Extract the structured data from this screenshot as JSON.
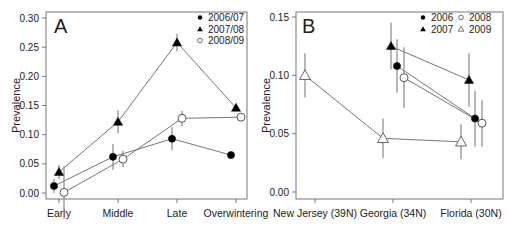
{
  "chart_data": [
    {
      "panel": "A",
      "type": "line",
      "title": "",
      "panel_label": "A",
      "xlabel": "",
      "ylabel": "Prevalence",
      "categories": [
        "Early",
        "Middle",
        "Late",
        "Overwintering"
      ],
      "ylim": [
        0.0,
        0.3
      ],
      "yticks": [
        "0.00",
        "0.05",
        "0.10",
        "0.15",
        "0.20",
        "0.25",
        "0.30"
      ],
      "grid": false,
      "legend_position": "top-right",
      "error_bars": true,
      "series": [
        {
          "name": "2006/07",
          "marker": "filled-circle",
          "values": [
            0.012,
            0.062,
            0.093,
            0.065
          ],
          "err": [
            0.012,
            0.022,
            0.02,
            0.003
          ]
        },
        {
          "name": "2007/08",
          "marker": "filled-triangle",
          "values": [
            0.036,
            0.122,
            0.258,
            0.146
          ],
          "err": [
            0.012,
            0.02,
            0.015,
            0.006
          ]
        },
        {
          "name": "2008/09",
          "marker": "open-circle",
          "values": [
            0.001,
            0.058,
            0.128,
            0.13
          ],
          "err": [
            0.045,
            0.014,
            0.013,
            0.006
          ]
        }
      ]
    },
    {
      "panel": "B",
      "type": "line",
      "title": "",
      "panel_label": "B",
      "xlabel": "",
      "ylabel": "Prevalence",
      "categories": [
        "New Jersey (39N)",
        "Georgia (34N)",
        "Florida (30N)"
      ],
      "ylim": [
        0.0,
        0.15
      ],
      "yticks": [
        "0.00",
        "0.05",
        "0.10",
        "0.15"
      ],
      "grid": false,
      "legend_position": "top-right",
      "error_bars": true,
      "series": [
        {
          "name": "2006",
          "marker": "filled-circle",
          "values": [
            null,
            0.108,
            0.063
          ],
          "err": [
            null,
            0.023,
            0.024
          ]
        },
        {
          "name": "2007",
          "marker": "filled-triangle",
          "values": [
            null,
            0.125,
            0.096
          ],
          "err": [
            null,
            0.02,
            0.023
          ]
        },
        {
          "name": "2008",
          "marker": "open-circle",
          "values": [
            null,
            0.098,
            0.059
          ],
          "err": [
            null,
            0.026,
            0.02
          ]
        },
        {
          "name": "2009",
          "marker": "open-triangle",
          "values": [
            0.1,
            0.046,
            0.043
          ],
          "err": [
            0.019,
            0.017,
            0.015
          ]
        }
      ]
    }
  ]
}
